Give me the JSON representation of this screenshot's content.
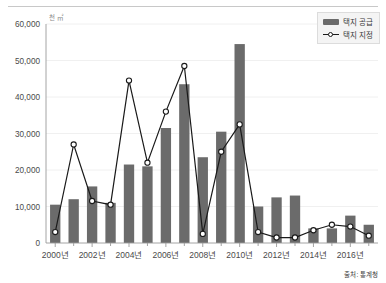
{
  "chart_data": {
    "type": "bar",
    "title": "",
    "xlabel": "",
    "ylabel": "",
    "unit_label": "천 ㎡",
    "source_note": "출처: 통계청",
    "ylim": [
      0,
      60000
    ],
    "ytick_labels": [
      "0",
      "10,000",
      "20,000",
      "30,000",
      "40,000",
      "50,000",
      "60,000"
    ],
    "ytick_values": [
      0,
      10000,
      20000,
      30000,
      40000,
      50000,
      60000
    ],
    "grid": true,
    "legend_position": "top-right",
    "categories": [
      "2000년",
      "2001년",
      "2002년",
      "2003년",
      "2004년",
      "2005년",
      "2006년",
      "2007년",
      "2008년",
      "2009년",
      "2010년",
      "2011년",
      "2012년",
      "2013년",
      "2014년",
      "2015년",
      "2016년",
      "2017년"
    ],
    "xtick_labels": [
      "2000년",
      "2002년",
      "2004년",
      "2006년",
      "2008년",
      "2010년",
      "2012년",
      "2014년",
      "2016년"
    ],
    "xtick_indices": [
      0,
      2,
      4,
      6,
      8,
      10,
      12,
      14,
      16
    ],
    "series": [
      {
        "name": "택지 공급",
        "type": "bar",
        "color": "#6b6b6b",
        "values": [
          10500,
          12000,
          15500,
          11000,
          21500,
          21000,
          31500,
          43500,
          23500,
          30500,
          54500,
          10000,
          12500,
          13000,
          4000,
          4000,
          7500,
          5000
        ]
      },
      {
        "name": "택지 지정",
        "type": "line",
        "color": "#1a1a1a",
        "values": [
          3000,
          27000,
          11500,
          10500,
          44500,
          22000,
          36000,
          48500,
          2500,
          25000,
          32500,
          3000,
          1500,
          1500,
          3500,
          5000,
          4500,
          2000
        ]
      }
    ]
  },
  "legend": {
    "items": [
      {
        "label": "택지 공급",
        "style": "bar"
      },
      {
        "label": "택지 지정",
        "style": "line"
      }
    ]
  }
}
